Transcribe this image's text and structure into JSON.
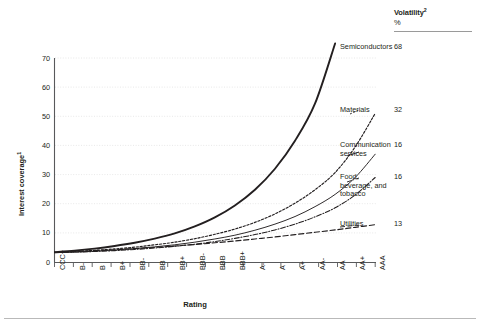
{
  "chart_data": {
    "type": "line",
    "title": "",
    "xlabel": "Rating",
    "ylabel": "Interest coverage",
    "ylabel_superscript": "1",
    "ylim": [
      0,
      70
    ],
    "yticks": [
      0,
      10,
      20,
      30,
      40,
      50,
      60,
      70
    ],
    "grid": "horizontal-dotted",
    "legend_position": "right",
    "categories": [
      "CCC+",
      "B-",
      "B",
      "B+",
      "BB-",
      "BB",
      "BB+",
      "BBB-",
      "BBB",
      "BBB+",
      "A-",
      "A",
      "A+",
      "AA-",
      "AA",
      "AA+",
      "AAA"
    ],
    "series": [
      {
        "name": "Semiconductors",
        "volatility": "68",
        "style": "solid-thick",
        "clipped_above_axis": true,
        "values": [
          3.4,
          3.9,
          4.6,
          5.5,
          6.6,
          8.0,
          9.8,
          12.2,
          15.3,
          19.4,
          24.8,
          32.0,
          41.6,
          54.4,
          75.0,
          null,
          null
        ]
      },
      {
        "name": "Materials",
        "volatility": "32",
        "style": "dotted",
        "values": [
          3.3,
          3.6,
          4.0,
          4.5,
          5.1,
          5.9,
          6.8,
          8.0,
          9.5,
          11.3,
          13.6,
          16.5,
          20.2,
          24.8,
          30.7,
          39.5,
          51.0
        ]
      },
      {
        "name": "Communication services",
        "volatility": "16",
        "style": "solid-thin",
        "values": [
          3.2,
          3.4,
          3.7,
          4.1,
          4.6,
          5.2,
          5.9,
          6.8,
          7.9,
          9.2,
          10.9,
          13.0,
          15.6,
          19.0,
          23.2,
          29.0,
          37.0
        ]
      },
      {
        "name": "Food, beverage, and tobacco",
        "volatility": "16",
        "style": "dash-dot",
        "values": [
          3.2,
          3.4,
          3.6,
          3.9,
          4.3,
          4.8,
          5.4,
          6.1,
          7.0,
          8.1,
          9.4,
          11.0,
          13.0,
          15.5,
          18.6,
          23.0,
          29.0
        ]
      },
      {
        "name": "Utilities",
        "volatility": "13",
        "style": "long-dash",
        "values": [
          3.3,
          3.6,
          3.9,
          4.2,
          4.6,
          5.0,
          5.5,
          6.0,
          6.6,
          7.2,
          7.9,
          8.6,
          9.4,
          10.2,
          11.0,
          11.9,
          12.8
        ]
      }
    ]
  },
  "legend": {
    "header_title": "Volatility",
    "header_superscript": "2",
    "header_unit": "%",
    "rows": [
      {
        "label": "Semiconductors",
        "value": "68"
      },
      {
        "label": "Materials",
        "value": "32"
      },
      {
        "label": "Communication services",
        "value": "16"
      },
      {
        "label": "Food, beverage, and tobacco",
        "value": "16"
      },
      {
        "label": "Utilities",
        "value": "13"
      }
    ]
  },
  "axes": {
    "y_title": "Interest coverage",
    "y_title_superscript": "1",
    "x_title": "Rating",
    "y_tick_labels": [
      "70",
      "60",
      "50",
      "40",
      "30",
      "20",
      "10",
      "0"
    ],
    "x_tick_labels": [
      "CCC+",
      "B-",
      "B",
      "B+",
      "BB-",
      "BB",
      "BB+",
      "BBB-",
      "BBB",
      "BBB+",
      "A-",
      "A",
      "A+",
      "AA-",
      "AA",
      "AA+",
      "AAA"
    ]
  }
}
